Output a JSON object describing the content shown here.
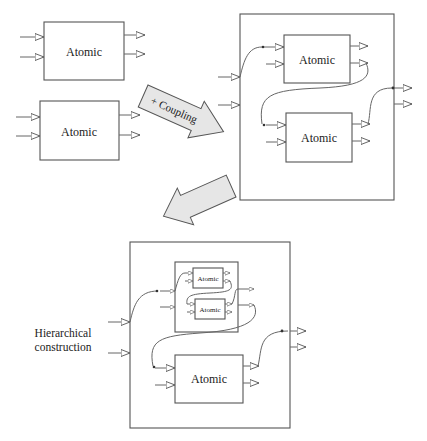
{
  "diagram": {
    "atomic_label": "Atomic",
    "coupling_arrow_label": "+ Coupling",
    "hierarchical_label_line1": "Hierarchical",
    "hierarchical_label_line2": "construction",
    "colors": {
      "stroke": "#555555",
      "arrow_fill": "#e6e6e6",
      "background": "#ffffff"
    },
    "stages": [
      {
        "name": "atomic-models",
        "components": [
          "Atomic",
          "Atomic"
        ]
      },
      {
        "name": "coupled-model",
        "components": [
          "Atomic",
          "Atomic"
        ]
      },
      {
        "name": "hierarchical-model",
        "components": [
          {
            "coupled": [
              "Atomic",
              "Atomic"
            ]
          },
          "Atomic"
        ]
      }
    ]
  }
}
